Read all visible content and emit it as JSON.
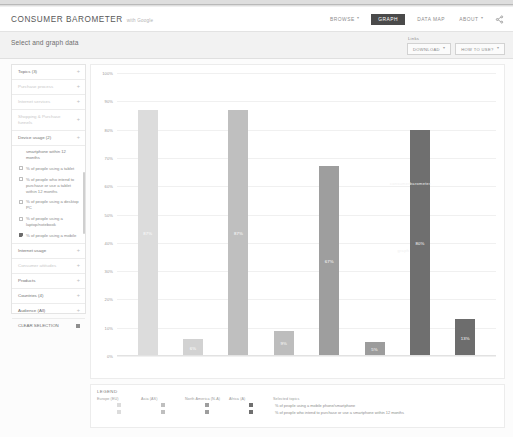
{
  "header": {
    "brand_title": "CONSUMER BAROMETER",
    "brand_sub": "with Google",
    "nav": [
      {
        "label": "BROWSE",
        "caret": "▾",
        "active": false
      },
      {
        "label": "GRAPH",
        "caret": "",
        "active": true
      },
      {
        "label": "DATA MAP",
        "caret": "",
        "active": false
      },
      {
        "label": "ABOUT",
        "caret": "▾",
        "active": false
      }
    ],
    "share_icon": "share-icon"
  },
  "subheader": {
    "title": "Select and graph data",
    "links_label": "Links",
    "buttons": [
      {
        "label": "DOWNLOAD",
        "caret": "▾"
      },
      {
        "label": "HOW TO USE?",
        "caret": "▾"
      }
    ]
  },
  "sidebar": {
    "sections": [
      {
        "label": "Topics (3)",
        "plus": "+",
        "dim": false
      },
      {
        "label": "Purchase process",
        "plus": "+",
        "dim": true
      },
      {
        "label": "Internet services",
        "plus": "+",
        "dim": true
      },
      {
        "label": "Shopping & Purchase funnels",
        "plus": "+",
        "dim": true
      },
      {
        "label": "Device usage (2)",
        "plus": "+",
        "dim": false
      }
    ],
    "options": [
      {
        "label": "smartphone within 12 months",
        "checked": false,
        "nocheckbox": true
      },
      {
        "label": "% of people using a tablet",
        "checked": false,
        "nocheckbox": false
      },
      {
        "label": "% of people who intend to purchase or use a tablet within 12 months",
        "checked": false,
        "nocheckbox": false
      },
      {
        "label": "% of people using a desktop PC",
        "checked": false,
        "nocheckbox": false
      },
      {
        "label": "% of people using a laptop/notebook",
        "checked": false,
        "nocheckbox": false
      },
      {
        "label": "% of people using a mobile",
        "checked": true,
        "nocheckbox": false
      }
    ],
    "sections_bottom": [
      {
        "label": "Internet usage",
        "plus": "+",
        "dim": false,
        "icon": ""
      },
      {
        "label": "Consumer attitudes",
        "plus": "+",
        "dim": true,
        "icon": ""
      },
      {
        "label": "Products",
        "plus": "+",
        "dim": false,
        "icon": ""
      },
      {
        "label": "Countries (4)",
        "plus": "+",
        "dim": false,
        "icon": ""
      },
      {
        "label": "Audience (All)",
        "plus": "+",
        "dim": false,
        "icon": ""
      },
      {
        "label": "CLEAR SELECTION",
        "plus": "",
        "dim": false,
        "icon": "trash-icon"
      }
    ]
  },
  "chart_data": {
    "type": "bar",
    "title": "",
    "xlabel": "",
    "ylabel": "",
    "ylim": [
      0,
      100
    ],
    "grid": true,
    "ytick_labels": [
      "100%",
      "90%",
      "80%",
      "70%",
      "60%",
      "50%",
      "40%",
      "30%",
      "20%",
      "10%",
      "0%"
    ],
    "yticks": [
      100,
      90,
      80,
      70,
      60,
      50,
      40,
      30,
      20,
      10,
      0
    ],
    "categories": [
      "Europe (EU)",
      "Asia (AS)",
      "North America (N-A)",
      "Africa (A)"
    ],
    "series": [
      {
        "name": "% of people using a mobile phone/smartphone",
        "color": "#d4d4d4",
        "values": [
          87,
          87,
          67,
          80
        ]
      },
      {
        "name": "% of people who intend to purchase or use a smartphone within 12 months",
        "color": "#bdbdbd",
        "values": [
          6,
          9,
          5,
          13
        ]
      }
    ],
    "bars": [
      {
        "value": 87,
        "label": "87%",
        "color": "#dcdcdc"
      },
      {
        "value": 6,
        "label": "6%",
        "color": "#d2d2d2"
      },
      {
        "value": 87,
        "label": "87%",
        "color": "#bfbfbf"
      },
      {
        "value": 9,
        "label": "9%",
        "color": "#bdbdbd"
      },
      {
        "value": 67,
        "label": "67%",
        "color": "#9e9e9e"
      },
      {
        "value": 5,
        "label": "5%",
        "color": "#9c9c9c"
      },
      {
        "value": 80,
        "label": "80%",
        "color": "#6f6f6f"
      },
      {
        "value": 13,
        "label": "13%",
        "color": "#6d6d6d"
      }
    ],
    "watermarks": [
      "consumerbarometer",
      "graph"
    ]
  },
  "legend": {
    "title": "LEGEND",
    "country_headers": [
      "Europe (EU)",
      "Asia (AS)",
      "North America (N-A)",
      "Africa (A)"
    ],
    "topics_header": "Selected topics",
    "rows": [
      {
        "label": "% of people using a mobile phone/smartphone",
        "colors": [
          "#dcdcdc",
          "#bfbfbf",
          "#9e9e9e",
          "#6f6f6f"
        ]
      },
      {
        "label": "% of people who intend to purchase or use a smartphone within 12 months",
        "colors": [
          "#dcdcdc",
          "#bfbfbf",
          "#9e9e9e",
          "#6f6f6f"
        ]
      }
    ]
  }
}
